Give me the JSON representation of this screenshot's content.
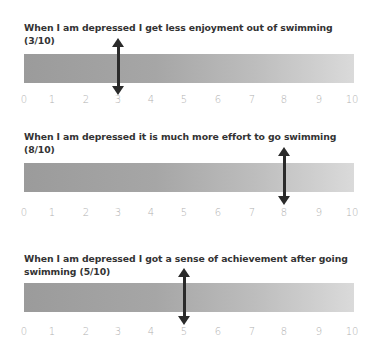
{
  "chart_data": [
    {
      "type": "bar",
      "title": "When I am depressed I get less enjoyment out of swimming (3/10)",
      "value": 3,
      "xlim": [
        0,
        10
      ],
      "tick_labels": [
        "0",
        "1",
        "2",
        "3",
        "4",
        "5",
        "6",
        "7",
        "8",
        "9",
        "10"
      ],
      "xlabel": "",
      "ylabel": ""
    },
    {
      "type": "bar",
      "title": "When I am depressed it is much more effort to go swimming (8/10)",
      "value": 8,
      "xlim": [
        0,
        10
      ],
      "tick_labels": [
        "0",
        "1",
        "2",
        "3",
        "4",
        "5",
        "6",
        "7",
        "8",
        "9",
        "10"
      ],
      "xlabel": "",
      "ylabel": ""
    },
    {
      "type": "bar",
      "title": "When I am depressed I got a sense of achievement after going swimming (5/10)",
      "value": 5,
      "xlim": [
        0,
        10
      ],
      "tick_labels": [
        "0",
        "1",
        "2",
        "3",
        "4",
        "5",
        "6",
        "7",
        "8",
        "9",
        "10"
      ],
      "xlabel": "",
      "ylabel": ""
    }
  ],
  "scales": [
    {
      "title": "When I am depressed I get less enjoyment out of swimming (3/10)",
      "value": 3
    },
    {
      "title": "When I am depressed it is much more effort to go swimming (8/10)",
      "value": 8
    },
    {
      "title": "When I am depressed I got a sense of achievement after going swimming (5/10)",
      "value": 5
    }
  ],
  "ticks": [
    "0",
    "1",
    "2",
    "3",
    "4",
    "5",
    "6",
    "7",
    "8",
    "9",
    "10"
  ],
  "colors": {
    "bar_dark": "#9b9b9b",
    "bar_light": "#dadada",
    "arrow": "#2b2b2b",
    "title": "#333333",
    "tick": "#b0b0b0"
  }
}
